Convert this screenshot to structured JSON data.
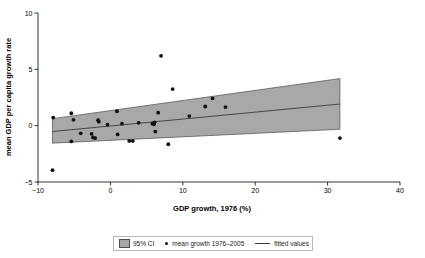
{
  "chart_data": {
    "type": "scatter",
    "title": "",
    "xlabel": "GDP growth, 1976 (%)",
    "ylabel": "mean GDP per capita growth rate",
    "xlim": [
      -10,
      40
    ],
    "ylim": [
      -5,
      10
    ],
    "xticks": [
      -10,
      0,
      10,
      20,
      30,
      40
    ],
    "yticks": [
      -5,
      0,
      5,
      10
    ],
    "xtick_labels": [
      "−10",
      "0",
      "10",
      "20",
      "30",
      "40"
    ],
    "ytick_labels": [
      "−5",
      "0",
      "5",
      "10"
    ],
    "grid": false,
    "legend_position": "below-outside",
    "series": [
      {
        "name": "mean growth 1976–2005",
        "type": "scatter",
        "marker": "circle",
        "color": "#111111",
        "points": [
          [
            -8.0,
            -3.95
          ],
          [
            -7.9,
            0.72
          ],
          [
            -5.4,
            1.1
          ],
          [
            -5.4,
            -1.4
          ],
          [
            -5.1,
            0.52
          ],
          [
            -4.1,
            -0.68
          ],
          [
            -2.6,
            -0.72
          ],
          [
            -2.4,
            -1.05
          ],
          [
            -2.1,
            -1.1
          ],
          [
            -1.7,
            0.48
          ],
          [
            -1.6,
            0.35
          ],
          [
            -0.4,
            0.08
          ],
          [
            0.9,
            1.28
          ],
          [
            1.0,
            -0.78
          ],
          [
            1.6,
            0.18
          ],
          [
            2.6,
            -1.35
          ],
          [
            3.1,
            -1.35
          ],
          [
            3.9,
            0.25
          ],
          [
            5.8,
            0.18
          ],
          [
            6.0,
            0.12
          ],
          [
            6.1,
            0.3
          ],
          [
            6.2,
            -0.52
          ],
          [
            6.6,
            1.15
          ],
          [
            7.0,
            6.2
          ],
          [
            8.0,
            -1.65
          ],
          [
            8.6,
            3.25
          ],
          [
            10.9,
            0.85
          ],
          [
            13.1,
            1.7
          ],
          [
            14.1,
            2.42
          ],
          [
            15.9,
            1.65
          ],
          [
            31.7,
            -1.1
          ]
        ]
      },
      {
        "name": "fitted values",
        "type": "line",
        "color": "#3b3b3b",
        "line": {
          "x": [
            -8.0,
            31.7
          ],
          "y": [
            -0.52,
            1.92
          ]
        }
      },
      {
        "name": "95% CI",
        "type": "band",
        "color": "#a8a8a8",
        "band": {
          "x": [
            -8.0,
            31.7
          ],
          "upper": [
            0.62,
            4.18
          ],
          "lower": [
            -1.55,
            -0.32
          ]
        }
      }
    ]
  },
  "axes": {
    "x_title": "GDP growth, 1976 (%)",
    "y_title": "mean GDP per capita growth rate",
    "x_ticks": [
      "−10",
      "0",
      "10",
      "20",
      "30",
      "40"
    ],
    "y_ticks": [
      "−5",
      "0",
      "5",
      "10"
    ]
  },
  "legend": {
    "items": [
      {
        "label": "95% CI",
        "kind": "ci-swatch"
      },
      {
        "label": "mean growth 1976–2005",
        "kind": "dot-swatch"
      },
      {
        "label": "fitted values",
        "kind": "line-swatch"
      }
    ]
  },
  "colors": {
    "ci_fill": "#a8a8a8",
    "ci_edge": "#4d4d4d",
    "point": "#111111",
    "fit_line": "#3b3b3b",
    "axis": "#000000",
    "legend_border": "#b9b9b9",
    "background": "#ffffff"
  }
}
